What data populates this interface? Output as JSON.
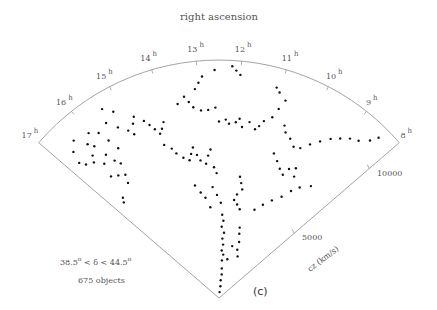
{
  "figure": {
    "title": "right ascension",
    "panel_label": "(c)",
    "declination_range": "38.5° < δ < 44.5°",
    "dec_low": "38.5",
    "dec_high": "44.5",
    "object_count_label": "675 objects",
    "axis_label_cz": "cz (km/s)",
    "colors": {
      "line": "#999999",
      "point": "#111111",
      "text": "#555555"
    }
  },
  "chart_data": {
    "type": "scatter",
    "title": "right ascension",
    "subtitle": "38.5° < δ < 44.5°, 675 objects",
    "projection": "polar wedge (RA vs cz)",
    "ra_ticks": [
      "17",
      "16",
      "15",
      "14",
      "13",
      "12",
      "11",
      "10",
      "9",
      "8"
    ],
    "ra_range_h": [
      8,
      17
    ],
    "cz_ticks": [
      5000,
      10000
    ],
    "cz_label": "cz (km/s)",
    "cz_max": 12000,
    "points_ra_cz": [
      [
        16.7,
        9800
      ],
      [
        16.6,
        9500
      ],
      [
        16.4,
        9300
      ],
      [
        16.2,
        8900
      ],
      [
        16.3,
        9600
      ],
      [
        16.1,
        9900
      ],
      [
        16.0,
        9200
      ],
      [
        15.9,
        8700
      ],
      [
        16.2,
        10200
      ],
      [
        16.0,
        10600
      ],
      [
        15.8,
        10300
      ],
      [
        16.4,
        10800
      ],
      [
        16.6,
        10400
      ],
      [
        15.7,
        9700
      ],
      [
        15.6,
        9100
      ],
      [
        16.3,
        8200
      ],
      [
        16.1,
        8000
      ],
      [
        15.9,
        7800
      ],
      [
        15.8,
        8400
      ],
      [
        16.0,
        7400
      ],
      [
        16.5,
        7000
      ],
      [
        16.6,
        6800
      ],
      [
        15.5,
        10500
      ],
      [
        15.4,
        11200
      ],
      [
        15.2,
        10800
      ],
      [
        15.3,
        10000
      ],
      [
        15.1,
        9600
      ],
      [
        15.0,
        9300
      ],
      [
        14.9,
        9800
      ],
      [
        14.8,
        10100
      ],
      [
        14.6,
        9700
      ],
      [
        14.5,
        9400
      ],
      [
        14.4,
        9100
      ],
      [
        14.3,
        8800
      ],
      [
        14.2,
        9000
      ],
      [
        14.1,
        9300
      ],
      [
        14.3,
        8200
      ],
      [
        14.1,
        7900
      ],
      [
        14.0,
        7600
      ],
      [
        13.8,
        7300
      ],
      [
        13.6,
        7100
      ],
      [
        13.5,
        7400
      ],
      [
        13.4,
        7700
      ],
      [
        13.3,
        7300
      ],
      [
        13.2,
        7000
      ],
      [
        13.0,
        6800
      ],
      [
        12.9,
        7200
      ],
      [
        12.8,
        7500
      ],
      [
        12.7,
        6600
      ],
      [
        12.6,
        6300
      ],
      [
        13.1,
        10600
      ],
      [
        13.0,
        10900
      ],
      [
        12.9,
        11200
      ],
      [
        12.6,
        11500
      ],
      [
        12.2,
        11700
      ],
      [
        12.1,
        11500
      ],
      [
        12.0,
        11300
      ],
      [
        13.4,
        10300
      ],
      [
        13.6,
        10000
      ],
      [
        13.3,
        10000
      ],
      [
        13.2,
        9700
      ],
      [
        13.0,
        9500
      ],
      [
        12.8,
        9500
      ],
      [
        12.6,
        9600
      ],
      [
        12.5,
        8900
      ],
      [
        12.3,
        9000
      ],
      [
        12.2,
        8800
      ],
      [
        12.0,
        8900
      ],
      [
        11.9,
        9100
      ],
      [
        11.8,
        8700
      ],
      [
        11.6,
        9000
      ],
      [
        11.4,
        8700
      ],
      [
        11.3,
        8900
      ],
      [
        11.2,
        9200
      ],
      [
        11.0,
        9500
      ],
      [
        10.9,
        10000
      ],
      [
        10.8,
        10500
      ],
      [
        11.0,
        10800
      ],
      [
        11.1,
        11000
      ],
      [
        10.6,
        9300
      ],
      [
        10.5,
        9000
      ],
      [
        10.3,
        8800
      ],
      [
        10.1,
        8500
      ],
      [
        9.9,
        8600
      ],
      [
        9.7,
        9000
      ],
      [
        9.5,
        9400
      ],
      [
        9.3,
        9800
      ],
      [
        9.1,
        10100
      ],
      [
        8.9,
        10400
      ],
      [
        8.7,
        10600
      ],
      [
        8.5,
        11000
      ],
      [
        8.4,
        11400
      ],
      [
        10.6,
        7800
      ],
      [
        10.4,
        7500
      ],
      [
        10.2,
        7200
      ],
      [
        10.0,
        7000
      ],
      [
        9.9,
        7400
      ],
      [
        9.7,
        7600
      ],
      [
        9.6,
        7200
      ],
      [
        11.6,
        6200
      ],
      [
        11.5,
        5900
      ],
      [
        11.4,
        5600
      ],
      [
        11.6,
        5300
      ],
      [
        11.7,
        5000
      ],
      [
        11.5,
        4800
      ],
      [
        11.3,
        4600
      ],
      [
        12.3,
        4200
      ],
      [
        12.2,
        3900
      ],
      [
        12.3,
        3600
      ],
      [
        12.1,
        3300
      ],
      [
        12.2,
        3000
      ],
      [
        12.1,
        2700
      ],
      [
        12.2,
        2400
      ],
      [
        12.0,
        2200
      ],
      [
        12.1,
        1900
      ],
      [
        12.0,
        1500
      ],
      [
        11.9,
        1200
      ],
      [
        12.0,
        900
      ],
      [
        11.9,
        600
      ],
      [
        12.0,
        300
      ],
      [
        12.4,
        4800
      ],
      [
        12.6,
        5200
      ],
      [
        12.8,
        5600
      ],
      [
        13.0,
        4600
      ],
      [
        13.2,
        5100
      ],
      [
        13.4,
        5400
      ],
      [
        13.6,
        5800
      ],
      [
        11.0,
        3700
      ],
      [
        10.9,
        3400
      ],
      [
        10.7,
        3000
      ],
      [
        10.6,
        2600
      ],
      [
        10.3,
        2300
      ],
      [
        11.2,
        2700
      ],
      [
        11.4,
        2000
      ],
      [
        10.5,
        4800
      ],
      [
        10.2,
        5200
      ],
      [
        9.9,
        5600
      ],
      [
        9.6,
        6000
      ],
      [
        9.4,
        6500
      ],
      [
        9.2,
        6900
      ],
      [
        8.9,
        7300
      ]
    ]
  }
}
